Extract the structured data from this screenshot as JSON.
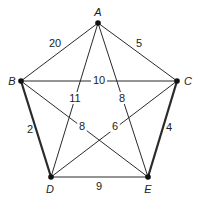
{
  "graph": {
    "nodes": [
      {
        "id": "A",
        "x": 98,
        "y": 23,
        "lx": 98,
        "ly": 16
      },
      {
        "id": "B",
        "x": 21,
        "y": 81,
        "lx": 12,
        "ly": 85
      },
      {
        "id": "C",
        "x": 177,
        "y": 81,
        "lx": 188,
        "ly": 85
      },
      {
        "id": "D",
        "x": 51,
        "y": 177,
        "lx": 50,
        "ly": 193
      },
      {
        "id": "E",
        "x": 148,
        "y": 177,
        "lx": 148,
        "ly": 193
      }
    ],
    "edges": [
      {
        "from": "A",
        "to": "B",
        "weight": "20",
        "lx": 55,
        "ly": 47,
        "bold": false,
        "bg": false
      },
      {
        "from": "A",
        "to": "C",
        "weight": "5",
        "lx": 139,
        "ly": 47,
        "bold": false,
        "bg": false
      },
      {
        "from": "B",
        "to": "C",
        "weight": "10",
        "lx": 99,
        "ly": 84,
        "bold": false,
        "bg": true
      },
      {
        "from": "A",
        "to": "D",
        "weight": "11",
        "lx": 75,
        "ly": 102,
        "bold": false,
        "bg": true
      },
      {
        "from": "A",
        "to": "E",
        "weight": "8",
        "lx": 122,
        "ly": 102,
        "bold": false,
        "bg": true
      },
      {
        "from": "B",
        "to": "D",
        "weight": "2",
        "lx": 30,
        "ly": 133,
        "bold": true,
        "bg": false
      },
      {
        "from": "B",
        "to": "E",
        "weight": "8",
        "lx": 82,
        "ly": 130,
        "bold": false,
        "bg": true
      },
      {
        "from": "C",
        "to": "D",
        "weight": "6",
        "lx": 115,
        "ly": 130,
        "bold": false,
        "bg": true
      },
      {
        "from": "C",
        "to": "E",
        "weight": "4",
        "lx": 169,
        "ly": 131,
        "bold": true,
        "bg": false
      },
      {
        "from": "D",
        "to": "E",
        "weight": "9",
        "lx": 99,
        "ly": 190,
        "bold": false,
        "bg": false
      }
    ]
  }
}
